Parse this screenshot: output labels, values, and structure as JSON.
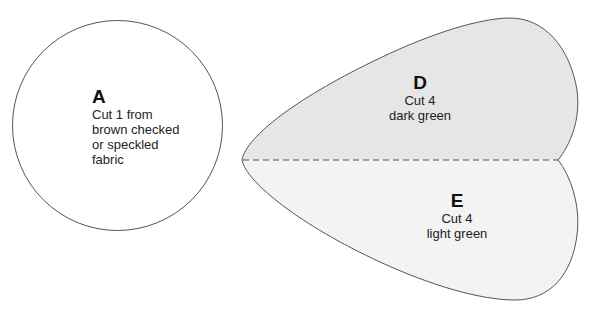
{
  "pieces": {
    "a": {
      "letter": "A",
      "lines": [
        "Cut 1 from",
        "brown checked",
        "or speckled",
        "fabric"
      ],
      "shape": "circle"
    },
    "d": {
      "letter": "D",
      "lines": [
        "Cut 4",
        "dark green"
      ],
      "shape": "upper-half-leaf"
    },
    "e": {
      "letter": "E",
      "lines": [
        "Cut 4",
        "light green"
      ],
      "shape": "lower-half-leaf"
    }
  },
  "colors": {
    "outline": "#555555",
    "piece_d_fill": "#e6e6e6",
    "piece_e_fill": "#f3f3f3",
    "circle_fill": "#ffffff",
    "dashed_line": "#555555"
  }
}
